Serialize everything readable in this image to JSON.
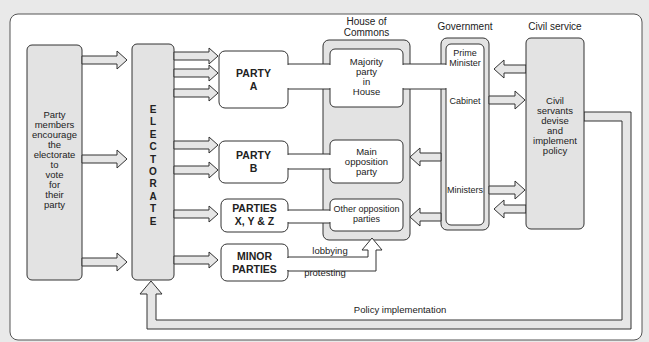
{
  "diagram": {
    "colors": {
      "background": "#e9e9e9",
      "frame": "#ffffff",
      "shaded_box": "#e3e3e3",
      "white_box": "#ffffff",
      "stroke": "#333333",
      "arrow_fill": "#e6e6e6"
    },
    "nodes": {
      "party_members": {
        "lines": [
          "Party",
          "members",
          "encourage",
          "the",
          "electorate",
          "to",
          "vote",
          "for",
          "their",
          "party"
        ]
      },
      "electorate": {
        "letters": [
          "E",
          "L",
          "E",
          "C",
          "T",
          "O",
          "R",
          "A",
          "T",
          "E"
        ]
      },
      "party_a": {
        "line1": "PARTY",
        "line2": "A"
      },
      "party_b": {
        "line1": "PARTY",
        "line2": "B"
      },
      "parties_xyz": {
        "line1": "PARTIES",
        "line2": "X, Y & Z"
      },
      "minor_parties": {
        "line1": "MINOR",
        "line2": "PARTIES"
      },
      "house_of_commons": {
        "heading_line1": "House of",
        "heading_line2": "Commons",
        "majority": [
          "Majority",
          "party",
          "in",
          "House"
        ],
        "main_opposition": [
          "Main",
          "opposition",
          "party"
        ],
        "other_opposition": [
          "Other opposition",
          "parties"
        ]
      },
      "government": {
        "heading": "Government",
        "prime_minister_line1": "Prime",
        "prime_minister_line2": "Minister",
        "cabinet": "Cabinet",
        "ministers": "Ministers"
      },
      "civil_service": {
        "heading": "Civil service",
        "lines": [
          "Civil",
          "servants",
          "devise",
          "and",
          "implement",
          "policy"
        ]
      }
    },
    "edge_labels": {
      "lobbying": "lobbying",
      "protesting": "protesting",
      "policy_implementation": "Policy implementation"
    }
  }
}
